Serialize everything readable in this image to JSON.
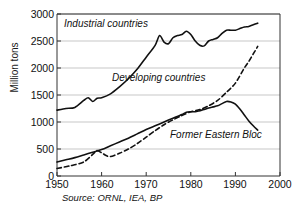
{
  "chart_data": {
    "type": "line",
    "title": "",
    "xlabel": "",
    "ylabel": "Million tons",
    "xlim": [
      1950,
      2000
    ],
    "ylim": [
      0,
      3000
    ],
    "xticks": [
      1950,
      1960,
      1970,
      1980,
      1990,
      2000
    ],
    "yticks": [
      0,
      500,
      1000,
      1500,
      2000,
      2500,
      3000
    ],
    "grid": "horizontal",
    "legend_position": "inline-annotations",
    "source": "Source: ORNL, IEA, BP",
    "series": [
      {
        "name": "Industrial countries",
        "style": "solid",
        "color": "#111111",
        "x": [
          1950,
          1952,
          1954,
          1956,
          1957,
          1958,
          1959,
          1960,
          1962,
          1964,
          1966,
          1968,
          1970,
          1972,
          1973,
          1974,
          1975,
          1976,
          1977,
          1978,
          1979,
          1980,
          1981,
          1982,
          1983,
          1984,
          1985,
          1986,
          1987,
          1988,
          1989,
          1990,
          1991,
          1992,
          1993,
          1994,
          1995
        ],
        "values": [
          1220,
          1250,
          1270,
          1400,
          1450,
          1380,
          1440,
          1450,
          1520,
          1650,
          1800,
          1980,
          2200,
          2420,
          2600,
          2480,
          2450,
          2560,
          2600,
          2620,
          2680,
          2620,
          2500,
          2420,
          2410,
          2500,
          2530,
          2560,
          2640,
          2700,
          2700,
          2700,
          2730,
          2760,
          2770,
          2800,
          2830
        ]
      },
      {
        "name": "Developing countries",
        "style": "dashed",
        "color": "#111111",
        "x": [
          1950,
          1953,
          1956,
          1958,
          1959,
          1960,
          1961,
          1962,
          1964,
          1966,
          1968,
          1970,
          1972,
          1974,
          1976,
          1978,
          1980,
          1982,
          1984,
          1986,
          1988,
          1990,
          1992,
          1993,
          1994,
          1995
        ],
        "values": [
          140,
          190,
          260,
          400,
          470,
          430,
          380,
          360,
          420,
          500,
          600,
          720,
          840,
          950,
          1040,
          1120,
          1190,
          1230,
          1300,
          1400,
          1550,
          1720,
          2000,
          2120,
          2260,
          2400
        ]
      },
      {
        "name": "Former Eastern Bloc",
        "style": "solid",
        "color": "#111111",
        "x": [
          1950,
          1952,
          1954,
          1956,
          1958,
          1960,
          1962,
          1964,
          1966,
          1968,
          1970,
          1972,
          1974,
          1976,
          1978,
          1979,
          1980,
          1981,
          1982,
          1983,
          1984,
          1985,
          1986,
          1987,
          1988,
          1989,
          1990,
          1991,
          1992,
          1993,
          1994,
          1995
        ],
        "values": [
          260,
          300,
          340,
          390,
          440,
          490,
          560,
          630,
          700,
          780,
          860,
          930,
          1000,
          1070,
          1140,
          1180,
          1190,
          1190,
          1210,
          1230,
          1260,
          1280,
          1300,
          1340,
          1380,
          1370,
          1330,
          1240,
          1130,
          1020,
          930,
          850
        ]
      }
    ]
  },
  "axis": {
    "y_title": "Million tons",
    "y_tick_labels": [
      "3000",
      "2500",
      "2000",
      "1500",
      "1000",
      "500",
      "0"
    ],
    "x_tick_labels": [
      "1950",
      "1960",
      "1970",
      "1980",
      "1990",
      "2000"
    ]
  },
  "annotations": {
    "industrial": "Industrial countries",
    "developing": "Developing countries",
    "eastern": "Former Eastern Bloc"
  },
  "footer": {
    "source": "Source: ORNL, IEA, BP"
  }
}
